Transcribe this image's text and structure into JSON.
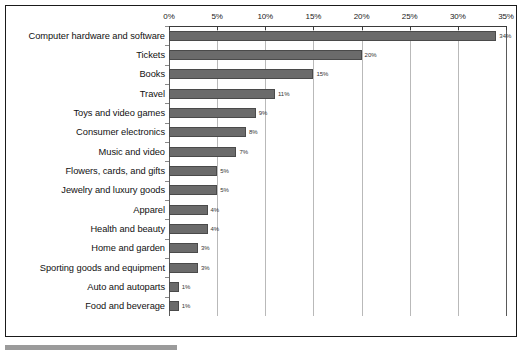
{
  "chart_data": {
    "type": "bar",
    "orientation": "horizontal",
    "title": "",
    "subtitle": "",
    "xlabel": "",
    "ylabel": "",
    "xlim": [
      0,
      35
    ],
    "grid": true,
    "legend": "none",
    "axis_ticks": [
      "0%",
      "5%",
      "10%",
      "15%",
      "20%",
      "25%",
      "30%",
      "35%"
    ],
    "axis_tick_values": [
      0,
      5,
      10,
      15,
      20,
      25,
      30,
      35
    ],
    "axis_position": "top",
    "categories": [
      "Computer hardware and software",
      "Tickets",
      "Books",
      "Travel",
      "Toys and video games",
      "Consumer electronics",
      "Music and video",
      "Flowers, cards, and gifts",
      "Jewelry and luxury goods",
      "Apparel",
      "Health and beauty",
      "Home and garden",
      "Sporting goods and equipment",
      "Auto and autoparts",
      "Food and beverage"
    ],
    "values": [
      34,
      20,
      15,
      11,
      9,
      8,
      7,
      5,
      5,
      4,
      4,
      3,
      3,
      1,
      1
    ],
    "value_labels": [
      "34%",
      "20%",
      "15%",
      "11%",
      "9%",
      "8%",
      "7%",
      "5%",
      "5%",
      "4%",
      "4%",
      "3%",
      "3%",
      "1%",
      "1%"
    ],
    "bar_color": "#6b6b6b",
    "grid_color": "#b9b9b9",
    "frame_color": "#1a1a1a",
    "background_color": "#ffffff"
  }
}
